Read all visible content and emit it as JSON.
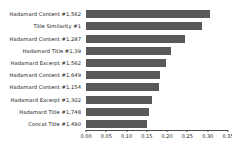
{
  "chart_data": {
    "type": "bar",
    "orientation": "horizontal",
    "title": "",
    "xlabel": "",
    "ylabel": "",
    "xlim": [
      0.0,
      0.35
    ],
    "grid": false,
    "legend": null,
    "bar_color": "#595959",
    "xticks": [
      "0.00",
      "0.05",
      "0.10",
      "0.15",
      "0.20",
      "0.25",
      "0.30",
      "0.35"
    ],
    "xtick_values": [
      0.0,
      0.05,
      0.1,
      0.15,
      0.2,
      0.25,
      0.3,
      0.35
    ],
    "categories": [
      "Hadamard Content #1,562",
      "Title Similarity #1",
      "Hadamard Content #1,287",
      "Hadamard Title #1,39",
      "Hadamard Excerpt #1,562",
      "Hadamard Content #1,649",
      "Hadamard Content #1,154",
      "Hadamard Excerpt #1,302",
      "Hadamard Title #1,748",
      "Concat Title #1,490"
    ],
    "values": [
      0.305,
      0.286,
      0.244,
      0.21,
      0.197,
      0.182,
      0.18,
      0.163,
      0.155,
      0.15
    ]
  }
}
